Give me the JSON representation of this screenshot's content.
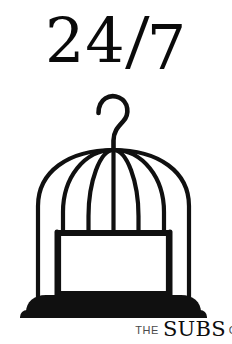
{
  "poster": {
    "background_color": "#ffffff",
    "ink_color": "#0d0d0d",
    "width": 232,
    "height": 344
  },
  "title": {
    "full_text": "24/7",
    "part_24": "24",
    "separator": "/",
    "part_7": "7"
  },
  "artwork": {
    "name": "birdcage-illustration",
    "description": "Black line-art birdcage with hook, domed top, vertical bars, square door panel and solid rounded base",
    "stroke_color": "#101010",
    "base_fill_color": "#101010",
    "bar_count": 7,
    "dome_rib_count": 7
  },
  "brand": {
    "the": "THE",
    "name": "SUBS",
    "suffix_visible": "CL"
  }
}
